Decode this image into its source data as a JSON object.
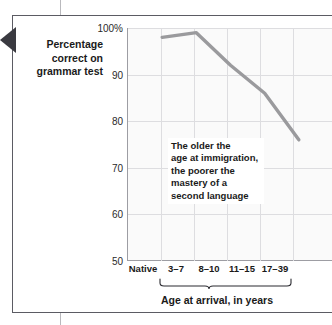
{
  "figure": {
    "marker_icon": "left-triangle-marker"
  },
  "chart_data": {
    "type": "line",
    "title": "",
    "subtitle": "",
    "xlabel": "Age at arrival, in years",
    "ylabel": "Percentage correct on grammar test",
    "ylabel_lines": [
      "Percentage",
      "correct on",
      "grammar test"
    ],
    "categories": [
      "Native",
      "3–7",
      "8–10",
      "11–15",
      "17–39"
    ],
    "values": [
      98,
      99,
      92,
      86,
      76
    ],
    "series": [
      {
        "name": "Percentage correct on grammar test",
        "values": [
          98,
          99,
          92,
          86,
          76
        ],
        "color": "#9a9a9d"
      }
    ],
    "ylim": [
      50,
      100
    ],
    "yticks": [
      100,
      90,
      80,
      70,
      60,
      50
    ],
    "ytick_labels": [
      "100%",
      "90",
      "80",
      "70",
      "60",
      "50"
    ],
    "grid": true,
    "legend": "none",
    "annotations": [
      {
        "name": "trend-annotation",
        "lines": [
          "The older the",
          "age at immigration,",
          "the poorer the",
          "mastery of a",
          "second language"
        ]
      }
    ],
    "brace": {
      "label": "Age at arrival, in years",
      "covers": [
        "3–7",
        "8–10",
        "11–15",
        "17–39"
      ]
    },
    "colors": {
      "line": "#9a9a9d",
      "grid": "#dddde0",
      "axis": "#9d9da3",
      "plot_background": "#fafafa",
      "text": "#1a1a1a",
      "marker": "#3a3a40"
    }
  }
}
